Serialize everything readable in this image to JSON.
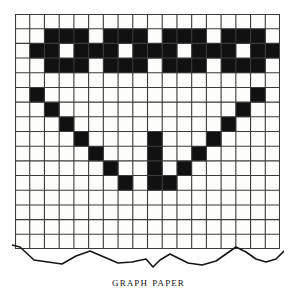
{
  "figure": {
    "caption": "Graph paper",
    "title": "Graph paper"
  },
  "grid": {
    "columns": 18,
    "rows": 16,
    "cell_size_px": 14.72,
    "origin_x_px": 15,
    "origin_y_px": 14,
    "line_color": "#3a3a3a",
    "fill_color": "#111111",
    "paper_color": "#fdfdfb",
    "line_width_px": 1.1
  },
  "tear": {
    "label": "torn-bottom-edge",
    "stroke_color": "#161616",
    "points": "0,2 8,4 22,17 36,19 50,21 64,13 78,8 92,14 106,20 120,19 134,16 141,24 148,17 158,11 166,15 176,20 190,22 204,18 214,11 224,4 234,9 244,16 254,19 264,16 272,8"
  },
  "chart_data": {
    "type": "heatmap",
    "title": "Graph paper",
    "xlabel": "",
    "ylabel": "",
    "grid": true,
    "categories_x": [
      "1",
      "2",
      "3",
      "4",
      "5",
      "6",
      "7",
      "8",
      "9",
      "10",
      "11",
      "12",
      "13",
      "14",
      "15",
      "16",
      "17",
      "18"
    ],
    "categories_y": [
      "1",
      "2",
      "3",
      "4",
      "5",
      "6",
      "7",
      "8",
      "9",
      "10",
      "11",
      "12",
      "13",
      "14",
      "15",
      "16"
    ],
    "legend": [],
    "values": [
      [
        0,
        0,
        0,
        0,
        0,
        0,
        0,
        0,
        0,
        0,
        0,
        0,
        0,
        0,
        0,
        0,
        0,
        0
      ],
      [
        0,
        0,
        1,
        1,
        1,
        0,
        1,
        1,
        1,
        0,
        1,
        1,
        1,
        0,
        1,
        1,
        1,
        0
      ],
      [
        0,
        1,
        1,
        0,
        1,
        1,
        1,
        0,
        1,
        1,
        1,
        0,
        1,
        1,
        1,
        0,
        1,
        1
      ],
      [
        0,
        0,
        1,
        1,
        1,
        0,
        1,
        1,
        1,
        0,
        1,
        1,
        1,
        0,
        1,
        1,
        1,
        0
      ],
      [
        0,
        0,
        0,
        0,
        0,
        0,
        0,
        0,
        0,
        0,
        0,
        0,
        0,
        0,
        0,
        0,
        0,
        0
      ],
      [
        0,
        1,
        0,
        0,
        0,
        0,
        0,
        0,
        0,
        0,
        0,
        0,
        0,
        0,
        0,
        0,
        1,
        0
      ],
      [
        0,
        0,
        1,
        0,
        0,
        0,
        0,
        0,
        0,
        0,
        0,
        0,
        0,
        0,
        0,
        1,
        0,
        0
      ],
      [
        0,
        0,
        0,
        1,
        0,
        0,
        0,
        0,
        0,
        0,
        0,
        0,
        0,
        0,
        1,
        0,
        0,
        0
      ],
      [
        0,
        0,
        0,
        0,
        1,
        0,
        0,
        0,
        0,
        1,
        0,
        0,
        0,
        1,
        0,
        0,
        0,
        0
      ],
      [
        0,
        0,
        0,
        0,
        0,
        1,
        0,
        0,
        0,
        1,
        0,
        0,
        1,
        0,
        0,
        0,
        0,
        0
      ],
      [
        0,
        0,
        0,
        0,
        0,
        0,
        1,
        0,
        0,
        1,
        0,
        1,
        0,
        0,
        0,
        0,
        0,
        0
      ],
      [
        0,
        0,
        0,
        0,
        0,
        0,
        0,
        1,
        0,
        1,
        1,
        0,
        0,
        0,
        0,
        0,
        0,
        0
      ],
      [
        0,
        0,
        0,
        0,
        0,
        0,
        0,
        0,
        0,
        0,
        0,
        0,
        0,
        0,
        0,
        0,
        0,
        0
      ],
      [
        0,
        0,
        0,
        0,
        0,
        0,
        0,
        0,
        0,
        0,
        0,
        0,
        0,
        0,
        0,
        0,
        0,
        0
      ],
      [
        0,
        0,
        0,
        0,
        0,
        0,
        0,
        0,
        0,
        0,
        0,
        0,
        0,
        0,
        0,
        0,
        0,
        0
      ],
      [
        0,
        0,
        0,
        0,
        0,
        0,
        0,
        0,
        0,
        0,
        0,
        0,
        0,
        0,
        0,
        0,
        0,
        0
      ]
    ]
  }
}
